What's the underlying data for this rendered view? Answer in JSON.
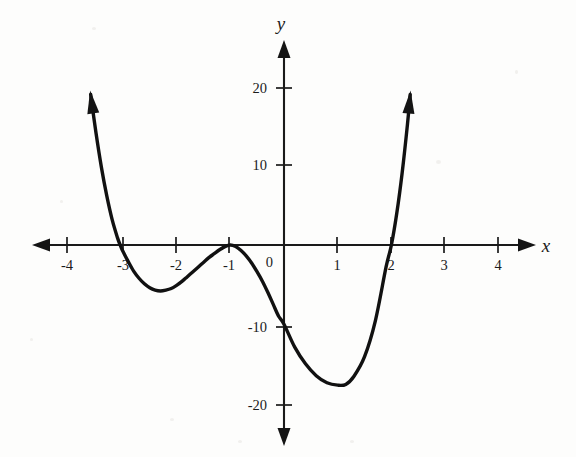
{
  "figure": {
    "kind": "cartesian-graph",
    "background_color": "#fdfdfc",
    "curve_color": "#111111",
    "axis_color": "#1a1a1a"
  },
  "axes": {
    "x_axis_label": "x",
    "y_axis_label": "y",
    "origin_label": "0",
    "x_tick_labels": [
      "-4",
      "-3",
      "-2",
      "-1",
      "1",
      "2",
      "3",
      "4"
    ],
    "y_tick_labels": [
      "20",
      "10",
      "-10",
      "-20"
    ]
  },
  "chart_data": {
    "type": "line",
    "title": "",
    "subtitle": "",
    "xlabel": "x",
    "ylabel": "y",
    "xlim": [
      -4.6,
      4.6
    ],
    "ylim": [
      -23,
      23
    ],
    "xticks": [
      -4,
      -3,
      -2,
      -1,
      0,
      1,
      2,
      3,
      4
    ],
    "yticks": [
      20,
      10,
      0,
      -10,
      -20
    ],
    "xtick_labels": [
      "-4",
      "-3",
      "-2",
      "-1",
      "0",
      "1",
      "2",
      "3",
      "4"
    ],
    "ytick_labels": [
      "20",
      "10",
      "",
      "-10",
      "-20"
    ],
    "grid": false,
    "legend": false,
    "legend_position": "none",
    "axis_style": "double-arrow-number-lines",
    "series": [
      {
        "name": "quartic polynomial",
        "expression_approx": "y = (x + 3)(x + 1)^2(x - 2)",
        "degree": 4,
        "line_width_px": 3.4,
        "color": "#111111",
        "end_arrows": [
          "up-left",
          "up-right"
        ],
        "x": [
          -3.6,
          -3.5,
          -3.4,
          -3.3,
          -3.2,
          -3.1,
          -3.05,
          -3.0,
          -2.9,
          -2.8,
          -2.7,
          -2.6,
          -2.5,
          -2.4,
          -2.3,
          -2.2,
          -2.1,
          -2.0,
          -1.9,
          -1.8,
          -1.7,
          -1.6,
          -1.5,
          -1.4,
          -1.3,
          -1.2,
          -1.1,
          -1.0,
          -0.9,
          -0.8,
          -0.7,
          -0.6,
          -0.5,
          -0.4,
          -0.3,
          -0.2,
          -0.1,
          0.0,
          0.2,
          0.4,
          0.6,
          0.8,
          1.0,
          1.15,
          1.3,
          1.5,
          1.7,
          1.9,
          2.0,
          2.1,
          2.2,
          2.3,
          2.35
        ],
        "y": [
          19.0,
          14.1,
          9.8,
          6.2,
          3.2,
          0.9,
          0.0,
          -0.8,
          -2.1,
          -3.3,
          -4.2,
          -4.9,
          -5.4,
          -5.7,
          -5.8,
          -5.7,
          -5.5,
          -5.1,
          -4.6,
          -4.0,
          -3.4,
          -2.8,
          -2.2,
          -1.6,
          -1.1,
          -0.6,
          -0.2,
          0.0,
          -0.2,
          -0.7,
          -1.4,
          -2.3,
          -3.4,
          -4.6,
          -6.0,
          -7.5,
          -9.0,
          -10.0,
          -12.9,
          -15.0,
          -16.5,
          -17.4,
          -17.7,
          -17.6,
          -16.6,
          -14.1,
          -9.6,
          -2.8,
          0.0,
          4.0,
          9.1,
          15.3,
          19.0
        ]
      }
    ],
    "key_points": [
      {
        "name": "left-root",
        "x": -3.05,
        "y": 0
      },
      {
        "name": "local-minimum-left",
        "x": -2.35,
        "y": -5.8
      },
      {
        "name": "tangent-root-local-maximum",
        "x": -1.0,
        "y": 0
      },
      {
        "name": "y-intercept",
        "x": 0,
        "y": -5.0
      },
      {
        "name": "global-minimum",
        "x": 1.15,
        "y": -17.7
      },
      {
        "name": "right-root",
        "x": 2.0,
        "y": 0
      }
    ]
  }
}
